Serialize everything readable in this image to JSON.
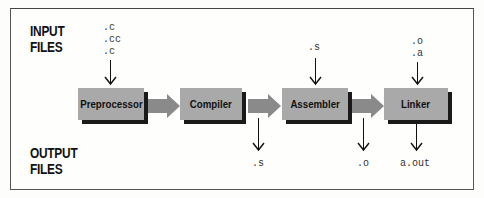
{
  "diagram": {
    "input_label": [
      "INPUT",
      "FILES"
    ],
    "output_label": [
      "OUTPUT",
      "FILES"
    ],
    "stages": [
      {
        "name": "Preprocessor",
        "inputs": [
          ".c",
          ".cc",
          ".c"
        ],
        "outputs": []
      },
      {
        "name": "Compiler",
        "inputs": [],
        "outputs": [
          ".s"
        ]
      },
      {
        "name": "Assembler",
        "inputs": [
          ".s"
        ],
        "outputs": [
          ".o"
        ]
      },
      {
        "name": "Linker",
        "inputs": [
          ".o",
          ".a"
        ],
        "outputs": [
          "a.out"
        ]
      }
    ],
    "colors": {
      "box_fill": "#a9a9a9",
      "box_shadow": "#1a1a1a",
      "pipe_arrow": "#8a8a8a",
      "text": "#111111"
    }
  }
}
